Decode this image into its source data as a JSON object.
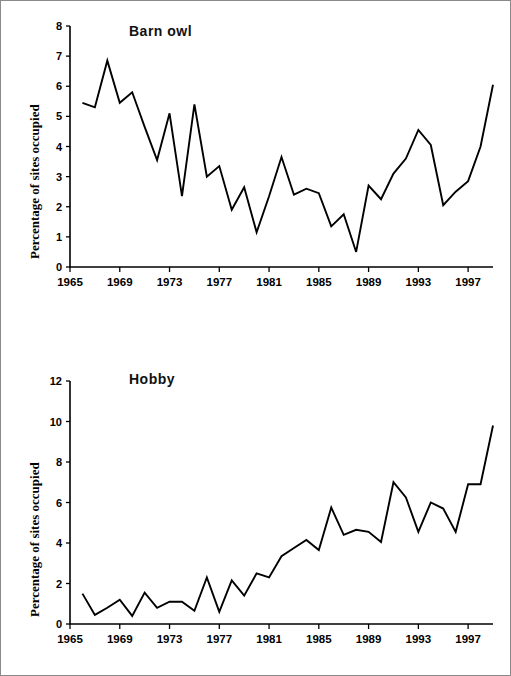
{
  "figure": {
    "background": "#ffffff",
    "border_color": "#8a8a8a",
    "line_color": "#000000"
  },
  "panels": [
    {
      "id": "barn-owl",
      "title": "Barn owl",
      "ylabel": "Percentage of sites occupied"
    },
    {
      "id": "hobby",
      "title": "Hobby",
      "ylabel": "Percentage of sites occupied"
    }
  ],
  "chart_data": [
    {
      "type": "line",
      "title": "Barn owl",
      "xlabel": "",
      "ylabel": "Percentage of sites occupied",
      "xlim": [
        1965,
        1999
      ],
      "ylim": [
        0,
        8
      ],
      "ytick_labels": [
        "0",
        "1",
        "2",
        "3",
        "4",
        "5",
        "6",
        "7",
        "8"
      ],
      "yticks": [
        0,
        1,
        2,
        3,
        4,
        5,
        6,
        7,
        8
      ],
      "xtick_labels": [
        "1965",
        "1969",
        "1973",
        "1977",
        "1981",
        "1985",
        "1989",
        "1993",
        "1997"
      ],
      "xticks": [
        1965,
        1969,
        1973,
        1977,
        1981,
        1985,
        1989,
        1993,
        1997
      ],
      "grid": false,
      "legend": "none",
      "x": [
        1966,
        1967,
        1968,
        1969,
        1970,
        1971,
        1972,
        1973,
        1974,
        1975,
        1976,
        1977,
        1978,
        1979,
        1980,
        1981,
        1982,
        1983,
        1984,
        1985,
        1986,
        1987,
        1988,
        1989,
        1990,
        1991,
        1992,
        1993,
        1994,
        1995,
        1996,
        1997,
        1998,
        1999
      ],
      "values": [
        5.45,
        5.3,
        6.85,
        5.45,
        5.8,
        4.65,
        3.55,
        5.1,
        2.35,
        5.4,
        3.0,
        3.35,
        1.9,
        2.65,
        1.15,
        2.35,
        3.65,
        2.4,
        2.6,
        2.45,
        1.35,
        1.75,
        0.5,
        2.7,
        2.25,
        3.1,
        3.6,
        4.55,
        4.05,
        2.05,
        2.5,
        2.85,
        4.0,
        6.05
      ]
    },
    {
      "type": "line",
      "title": "Hobby",
      "xlabel": "",
      "ylabel": "Percentage of sites occupied",
      "xlim": [
        1965,
        1999
      ],
      "ylim": [
        0,
        12
      ],
      "ytick_labels": [
        "0",
        "2",
        "4",
        "6",
        "8",
        "10",
        "12"
      ],
      "yticks": [
        0,
        2,
        4,
        6,
        8,
        10,
        12
      ],
      "xtick_labels": [
        "1965",
        "1969",
        "1973",
        "1977",
        "1981",
        "1985",
        "1989",
        "1993",
        "1997"
      ],
      "xticks": [
        1965,
        1969,
        1973,
        1977,
        1981,
        1985,
        1989,
        1993,
        1997
      ],
      "grid": false,
      "legend": "none",
      "x": [
        1966,
        1967,
        1968,
        1969,
        1970,
        1971,
        1972,
        1973,
        1974,
        1975,
        1976,
        1977,
        1978,
        1979,
        1980,
        1981,
        1982,
        1983,
        1984,
        1985,
        1986,
        1987,
        1988,
        1989,
        1990,
        1991,
        1992,
        1993,
        1994,
        1995,
        1996,
        1997,
        1998,
        1999
      ],
      "values": [
        1.5,
        0.45,
        0.8,
        1.2,
        0.4,
        1.55,
        0.8,
        1.1,
        1.1,
        0.65,
        2.3,
        0.6,
        2.15,
        1.4,
        2.5,
        2.3,
        3.35,
        3.75,
        4.15,
        3.65,
        5.75,
        4.4,
        4.65,
        4.55,
        4.05,
        7.0,
        6.25,
        4.55,
        6.0,
        5.7,
        4.55,
        6.9,
        6.9,
        9.8
      ]
    }
  ]
}
